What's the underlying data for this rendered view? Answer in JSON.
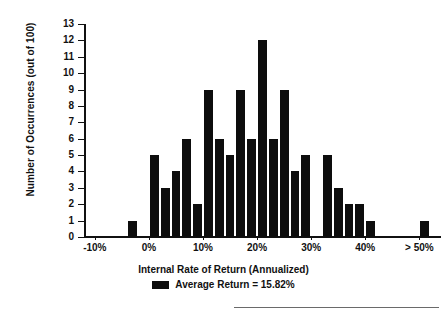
{
  "chart_data": {
    "type": "bar",
    "title": "",
    "xlabel": "Internal Rate of Return (Annualized)",
    "ylabel": "Number of Occurrences (out of 100)",
    "xtick_labels": [
      "-10%",
      "0%",
      "10%",
      "20%",
      "30%",
      "40%",
      "> 50%"
    ],
    "xtick_values": [
      -10,
      0,
      10,
      20,
      30,
      40,
      50
    ],
    "ytick_labels": [
      "0",
      "1",
      "2",
      "3",
      "4",
      "5",
      "6",
      "7",
      "8",
      "9",
      "10",
      "11",
      "12",
      "13"
    ],
    "ylim": [
      0,
      13
    ],
    "xlim": [
      -12,
      54
    ],
    "grid": false,
    "legend_position": "below-axis-center",
    "legend": [
      {
        "label": "Average Return = 15.82%",
        "color": "#0d0d0d",
        "marker": "filled-rectangle"
      }
    ],
    "bar_color": "#0d0d0d",
    "bin_width": 2,
    "categories": [
      "-10%",
      "-8%",
      "-6%",
      "-4%",
      "-2%",
      "0%",
      "2%",
      "4%",
      "6%",
      "8%",
      "10%",
      "12%",
      "14%",
      "16%",
      "18%",
      "20%",
      "22%",
      "24%",
      "26%",
      "28%",
      "30%",
      "32%",
      "34%",
      "36%",
      "38%",
      "40%",
      "42%",
      "44%",
      "46%",
      "48%",
      "> 50%"
    ],
    "values": [
      0,
      0,
      0,
      1,
      0,
      5,
      3,
      4,
      6,
      2,
      9,
      6,
      5,
      9,
      6,
      12,
      6,
      9,
      4,
      5,
      0,
      5,
      3,
      2,
      2,
      1,
      0,
      0,
      0,
      0,
      1
    ],
    "annotations": {
      "average_return": "15.82%",
      "total_occurrences": "100"
    }
  },
  "axis": {
    "y_title": "Number of Occurrences (out of 100)",
    "x_title": "Internal Rate of Return (Annualized)"
  },
  "legend": {
    "label": "Average Return = 15.82%"
  }
}
